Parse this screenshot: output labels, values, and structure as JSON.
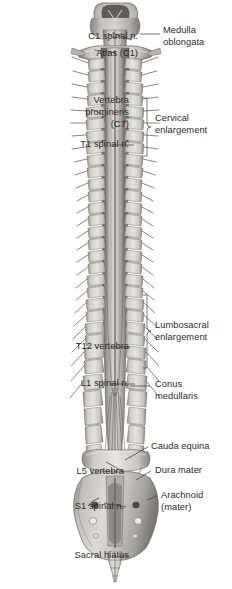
{
  "figure": {
    "background_color": "#ffffff",
    "text_color": "#2b2b2b",
    "leader_color": "#4a4a4a",
    "width": 232,
    "height": 589
  },
  "labels_left": [
    {
      "id": "c1-spinal-n",
      "lines": [
        "C1 spinal n."
      ],
      "x_right": 138,
      "y_top": 30
    },
    {
      "id": "atlas-c1",
      "lines": [
        "Atlas (C1)"
      ],
      "x_right": 138,
      "y_top": 47
    },
    {
      "id": "vertebra-prominens-c7",
      "lines": [
        "Vertebra",
        "prominens",
        "(C7)"
      ],
      "x_right": 129,
      "y_top": 94
    },
    {
      "id": "t1-spinal-n",
      "lines": [
        "T1 spinal n."
      ],
      "x_right": 129,
      "y_top": 138
    },
    {
      "id": "t12-vertebra",
      "lines": [
        "T12 vertebra"
      ],
      "x_right": 129,
      "y_top": 340
    },
    {
      "id": "l1-spinal-n",
      "lines": [
        "L1 spinal n."
      ],
      "x_right": 129,
      "y_top": 377
    },
    {
      "id": "l5-vertebra",
      "lines": [
        "L5 vertebra"
      ],
      "x_right": 124,
      "y_top": 465
    },
    {
      "id": "s1-spinal-n",
      "lines": [
        "S1 spinal n."
      ],
      "x_right": 124,
      "y_top": 500
    },
    {
      "id": "sacral-hiatus",
      "lines": [
        "Sacral hiatus"
      ],
      "x_right": 129,
      "y_top": 549
    }
  ],
  "labels_right": [
    {
      "id": "medulla-oblongata",
      "lines": [
        "Medulla",
        "oblongata"
      ],
      "x_left": 152,
      "y_top": 24
    },
    {
      "id": "cervical-enlargement",
      "lines": [
        "Cervical",
        "enlargement"
      ],
      "x_left": 155,
      "y_top": 112
    },
    {
      "id": "lumbosacral-enlargement",
      "lines": [
        "Lumbosacral",
        "enlargement"
      ],
      "x_left": 155,
      "y_top": 319
    },
    {
      "id": "conus-medullaris",
      "lines": [
        "Conus",
        "medullaris"
      ],
      "x_left": 152,
      "y_top": 378
    },
    {
      "id": "cauda-equina",
      "lines": [
        "Cauda equina"
      ],
      "x_left": 148,
      "y_top": 440
    },
    {
      "id": "dura-mater",
      "lines": [
        "Dura mater"
      ],
      "x_left": 152,
      "y_top": 464
    },
    {
      "id": "arachnoid-mater",
      "lines": [
        "Arachnoid",
        "(mater)"
      ],
      "x_left": 158,
      "y_top": 489
    }
  ],
  "brackets": [
    {
      "id": "cervical-enlargement-bracket",
      "label": "Cervical enlargement",
      "x": 146,
      "y_top": 98,
      "y_bottom": 156
    },
    {
      "id": "lumbosacral-enlargement-bracket",
      "label": "Lumbosacral enlargement",
      "x": 146,
      "y_top": 295,
      "y_bottom": 368
    }
  ],
  "anatomy": {
    "regions": [
      {
        "id": "medulla-oblongata",
        "name": "Medulla oblongata",
        "y_top": 4,
        "y_bottom": 45
      },
      {
        "id": "atlas",
        "name": "Atlas (C1) vertebra",
        "y_top": 45,
        "y_bottom": 58
      },
      {
        "id": "cervical-spine",
        "name": "Cervical vertebrae",
        "y_top": 58,
        "y_bottom": 150
      },
      {
        "id": "thoracic-spine",
        "name": "Thoracic vertebrae",
        "y_top": 150,
        "y_bottom": 355
      },
      {
        "id": "lumbar-spine",
        "name": "Lumbar vertebrae",
        "y_top": 355,
        "y_bottom": 480
      },
      {
        "id": "sacrum",
        "name": "Sacrum",
        "y_top": 480,
        "y_bottom": 558
      },
      {
        "id": "coccyx",
        "name": "Coccyx",
        "y_top": 558,
        "y_bottom": 585
      }
    ],
    "vertebra_count_visible": 31,
    "center_x": 115
  }
}
